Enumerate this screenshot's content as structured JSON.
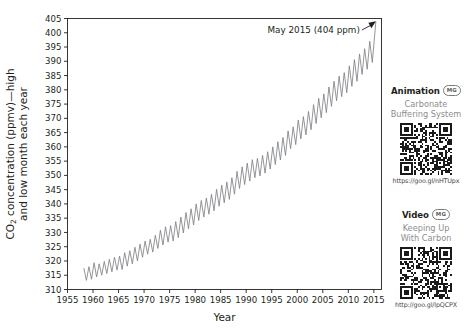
{
  "chart_data": {
    "type": "line",
    "title": "",
    "xlabel": "Year",
    "ylabel_line1": "CO2 concentration (ppmv)—high",
    "ylabel_line2": "and low month each year",
    "ylabel_prefix": "CO",
    "ylabel_sub": "2",
    "ylabel_rest1": " concentration (ppmv)—high",
    "xlim": [
      1955,
      2016.5
    ],
    "ylim": [
      310,
      405
    ],
    "grid": false,
    "legend": "none",
    "xticks": [
      1955,
      1960,
      1965,
      1970,
      1975,
      1980,
      1985,
      1990,
      1995,
      2000,
      2005,
      2010,
      2015
    ],
    "yticks": [
      310,
      315,
      320,
      325,
      330,
      335,
      340,
      345,
      350,
      355,
      360,
      365,
      370,
      375,
      380,
      385,
      390,
      395,
      400,
      405
    ],
    "annotation": {
      "text": "May 2015 (404 ppm)",
      "points_to_x": 2015.4,
      "points_to_y": 404
    },
    "series": [
      {
        "name": "Mauna Loa CO2 — monthly high and low",
        "x": [
          1958.2,
          1958.7,
          1959.2,
          1959.7,
          1960.2,
          1960.7,
          1961.2,
          1961.7,
          1962.2,
          1962.7,
          1963.2,
          1963.7,
          1964.2,
          1964.7,
          1965.2,
          1965.7,
          1966.2,
          1966.7,
          1967.2,
          1967.7,
          1968.2,
          1968.7,
          1969.2,
          1969.7,
          1970.2,
          1970.7,
          1971.2,
          1971.7,
          1972.2,
          1972.7,
          1973.2,
          1973.7,
          1974.2,
          1974.7,
          1975.2,
          1975.7,
          1976.2,
          1976.7,
          1977.2,
          1977.7,
          1978.2,
          1978.7,
          1979.2,
          1979.7,
          1980.2,
          1980.7,
          1981.2,
          1981.7,
          1982.2,
          1982.7,
          1983.2,
          1983.7,
          1984.2,
          1984.7,
          1985.2,
          1985.7,
          1986.2,
          1986.7,
          1987.2,
          1987.7,
          1988.2,
          1988.7,
          1989.2,
          1989.7,
          1990.2,
          1990.7,
          1991.2,
          1991.7,
          1992.2,
          1992.7,
          1993.2,
          1993.7,
          1994.2,
          1994.7,
          1995.2,
          1995.7,
          1996.2,
          1996.7,
          1997.2,
          1997.7,
          1998.2,
          1998.7,
          1999.2,
          1999.7,
          2000.2,
          2000.7,
          2001.2,
          2001.7,
          2002.2,
          2002.7,
          2003.2,
          2003.7,
          2004.2,
          2004.7,
          2005.2,
          2005.7,
          2006.2,
          2006.7,
          2007.2,
          2007.7,
          2008.2,
          2008.7,
          2009.2,
          2009.7,
          2010.2,
          2010.7,
          2011.2,
          2011.7,
          2012.2,
          2012.7,
          2013.2,
          2013.7,
          2014.2,
          2014.7,
          2015.4
        ],
        "y": [
          317.5,
          313.2,
          318.0,
          313.6,
          319.4,
          314.4,
          319.0,
          315.0,
          319.8,
          315.6,
          320.6,
          316.2,
          321.3,
          316.8,
          321.7,
          317.0,
          322.9,
          318.2,
          323.6,
          319.0,
          324.8,
          320.0,
          325.9,
          321.3,
          327.0,
          322.4,
          327.6,
          323.1,
          329.0,
          324.4,
          330.8,
          325.6,
          332.0,
          326.6,
          332.4,
          327.0,
          333.8,
          328.2,
          335.4,
          329.8,
          337.0,
          331.3,
          338.3,
          332.6,
          340.0,
          334.2,
          341.2,
          335.4,
          342.1,
          336.4,
          343.4,
          337.6,
          345.1,
          339.2,
          346.6,
          340.4,
          347.7,
          341.6,
          349.2,
          343.4,
          351.4,
          345.4,
          353.0,
          346.8,
          354.3,
          348.0,
          355.5,
          349.2,
          356.0,
          349.8,
          357.0,
          350.8,
          358.3,
          352.2,
          360.0,
          353.8,
          361.8,
          355.4,
          363.3,
          357.0,
          365.6,
          359.4,
          367.0,
          360.8,
          369.4,
          362.8,
          370.6,
          364.2,
          372.4,
          366.0,
          374.8,
          368.2,
          377.0,
          370.2,
          378.6,
          372.0,
          381.0,
          374.2,
          383.0,
          376.2,
          384.8,
          377.6,
          386.0,
          379.0,
          388.4,
          381.2,
          390.6,
          383.0,
          392.6,
          385.4,
          394.4,
          387.2,
          397.0,
          389.6,
          404.0
        ]
      }
    ]
  },
  "sidebar": {
    "cards": [
      {
        "kind": "Animation",
        "badge": "MG",
        "title_line1": "Carbonate",
        "title_line2": "Buffering System",
        "url": "https://goo.gl/nHTUpx"
      },
      {
        "kind": "Video",
        "badge": "MG",
        "title_line1": "Keeping Up",
        "title_line2": "With Carbon",
        "url": "http://goo.gl/lpQCPX"
      }
    ]
  },
  "colors": {
    "line": "#808285",
    "axis": "#231f20",
    "text": "#231f20",
    "muted": "#8d8d8d",
    "qr_dark": "#1a1a1a"
  }
}
